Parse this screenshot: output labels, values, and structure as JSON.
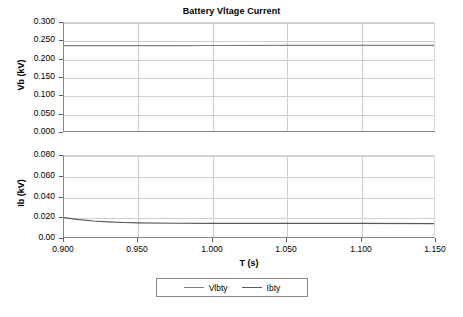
{
  "chart_data": {
    "type": "line",
    "title": "Battery Vltage Current",
    "xlabel": "T (s)",
    "grid": true,
    "legend_position": "bottom-center",
    "legend": [
      "Vlbty",
      "Ibty"
    ],
    "colors": {
      "vlbty": "#808080",
      "ibty": "#595959",
      "gridline": "#cfcfcf",
      "axis": "#848484",
      "text": "#000000"
    },
    "x": [
      0.9,
      0.91,
      0.92,
      0.93,
      0.94,
      0.95,
      0.975,
      1.0,
      1.05,
      1.1,
      1.15
    ],
    "xlim": [
      0.9,
      1.15
    ],
    "xticks": [
      "0.900",
      "0.950",
      "1.000",
      "1.050",
      "1.100",
      "1.150"
    ],
    "xtick_values": [
      0.9,
      0.95,
      1.0,
      1.05,
      1.1,
      1.15
    ],
    "panels": [
      {
        "id": "vb-panel",
        "ylabel": "Vb (kV)",
        "ylim": [
          0.0,
          0.3
        ],
        "yticks": [
          "0.000",
          "0.050",
          "0.100",
          "0.150",
          "0.200",
          "0.250",
          "0.300"
        ],
        "ytick_values": [
          0.0,
          0.05,
          0.1,
          0.15,
          0.2,
          0.25,
          0.3
        ],
        "series": [
          {
            "name": "Vlbty",
            "color": "#808080",
            "values": [
              0.237,
              0.2371,
              0.2372,
              0.2372,
              0.2373,
              0.2373,
              0.2374,
              0.2375,
              0.2376,
              0.2377,
              0.2378
            ]
          }
        ]
      },
      {
        "id": "ib-panel",
        "ylabel": "Ib (kV)",
        "ylim": [
          0.0,
          0.08
        ],
        "yticks": [
          "0.00",
          "0.020",
          "0.040",
          "0.060",
          "0.080"
        ],
        "ytick_values": [
          0.0,
          0.02,
          0.04,
          0.06,
          0.08
        ],
        "series": [
          {
            "name": "Ibty",
            "color": "#595959",
            "values": [
              0.0192,
              0.0172,
              0.0158,
              0.0149,
              0.0143,
              0.014,
              0.0136,
              0.0135,
              0.0134,
              0.0134,
              0.0133
            ]
          }
        ]
      }
    ]
  }
}
